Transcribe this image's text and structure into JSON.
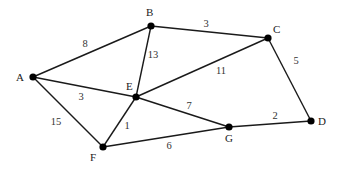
{
  "graph": {
    "type": "weighted-undirected-graph",
    "nodes": [
      {
        "id": "A",
        "label": "A",
        "x": 33,
        "y": 77,
        "lx": 16,
        "ly": 81
      },
      {
        "id": "B",
        "label": "B",
        "x": 151,
        "y": 26,
        "lx": 146,
        "ly": 16
      },
      {
        "id": "C",
        "label": "C",
        "x": 268,
        "y": 38,
        "lx": 273,
        "ly": 33
      },
      {
        "id": "D",
        "label": "D",
        "x": 311,
        "y": 121,
        "lx": 318,
        "ly": 125
      },
      {
        "id": "E",
        "label": "E",
        "x": 136,
        "y": 97,
        "lx": 126,
        "ly": 90
      },
      {
        "id": "F",
        "label": "F",
        "x": 103,
        "y": 147,
        "lx": 90,
        "ly": 161
      },
      {
        "id": "G",
        "label": "G",
        "x": 229,
        "y": 127,
        "lx": 225,
        "ly": 142
      }
    ],
    "edges": [
      {
        "from": "A",
        "to": "B",
        "weight": "8",
        "wx": 85,
        "wy": 47
      },
      {
        "from": "B",
        "to": "C",
        "weight": "3",
        "wx": 206,
        "wy": 27
      },
      {
        "from": "B",
        "to": "E",
        "weight": "13",
        "wx": 153,
        "wy": 58
      },
      {
        "from": "A",
        "to": "E",
        "weight": "3",
        "wx": 81,
        "wy": 100
      },
      {
        "from": "A",
        "to": "F",
        "weight": "15",
        "wx": 56,
        "wy": 125
      },
      {
        "from": "E",
        "to": "C",
        "weight": "11",
        "wx": 221,
        "wy": 74
      },
      {
        "from": "C",
        "to": "D",
        "weight": "5",
        "wx": 296,
        "wy": 64
      },
      {
        "from": "E",
        "to": "F",
        "weight": "1",
        "wx": 127,
        "wy": 129
      },
      {
        "from": "E",
        "to": "G",
        "weight": "7",
        "wx": 189,
        "wy": 109
      },
      {
        "from": "F",
        "to": "G",
        "weight": "6",
        "wx": 169,
        "wy": 149
      },
      {
        "from": "G",
        "to": "D",
        "weight": "2",
        "wx": 275,
        "wy": 119
      }
    ]
  }
}
